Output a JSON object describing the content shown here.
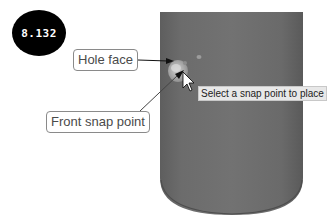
{
  "figure": {
    "number": "8.132"
  },
  "callouts": {
    "hole_face": "Hole face",
    "front_snap_point": "Front snap point"
  },
  "tooltip": {
    "text": "Select a snap point to place"
  },
  "colors": {
    "cylinder": "#6e6e6e",
    "cylinder_dark": "#565656",
    "hole_highlight": "#b4b4b4",
    "badge": "#000000",
    "callout_border": "#8a8a8a"
  },
  "icons": {
    "cursor": "arrow-pointer-icon"
  }
}
